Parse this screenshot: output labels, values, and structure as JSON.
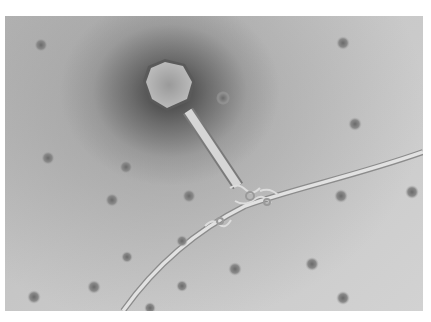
{
  "image": {
    "description": "Transmission electron micrograph of a bacteriophage attached to a bacterial flagellum (negative stain)",
    "colors": {
      "background": "#ffffff",
      "field": "#c4c4c4",
      "stain_dark": "#3c3c3c",
      "structure_light": "#e6e6e6"
    },
    "elements": [
      "phage-head",
      "phage-tail",
      "baseplate",
      "flagellum",
      "background-particles"
    ]
  }
}
